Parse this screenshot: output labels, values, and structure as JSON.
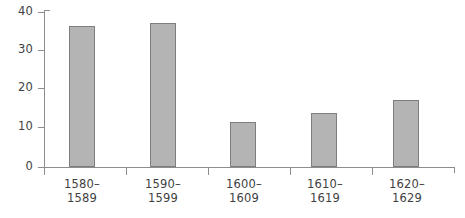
{
  "chart_data": {
    "type": "bar",
    "title": "",
    "subtitle": "",
    "xlabel": "",
    "ylabel": "",
    "categories": [
      "1580–\n1589",
      "1590–\n1599",
      "1600–\n1609",
      "1610–\n1619",
      "1620–\n1629"
    ],
    "category_lines": [
      [
        "1580–",
        "1589"
      ],
      [
        "1590–",
        "1599"
      ],
      [
        "1600–",
        "1609"
      ],
      [
        "1610–",
        "1619"
      ],
      [
        "1620–",
        "1629"
      ]
    ],
    "values": [
      36.4,
      37.2,
      11.6,
      13.9,
      17.3
    ],
    "ylim": [
      0,
      40
    ],
    "yticks": [
      0,
      10,
      20,
      30,
      40
    ],
    "ytick_labels": [
      "0",
      "10",
      "20",
      "30",
      "40"
    ],
    "xlim_note": "categorical",
    "grid": false,
    "legend": false,
    "legend_position": "none",
    "bar_fill_color": "#b4b4b4",
    "bar_border_color": "#7e7e7e",
    "axis_color": "#8d8d8d",
    "text_color": "#3f3f3f",
    "background_color": "#ffffff"
  },
  "axes": {
    "y": {
      "ticks": [
        {
          "label": "40",
          "value": 40
        },
        {
          "label": "30",
          "value": 30
        },
        {
          "label": "20",
          "value": 20
        },
        {
          "label": "10",
          "value": 10
        },
        {
          "label": "0",
          "value": 0
        }
      ]
    },
    "x": {
      "labels": [
        {
          "line1": "1580–",
          "line2": "1589"
        },
        {
          "line1": "1590–",
          "line2": "1599"
        },
        {
          "line1": "1600–",
          "line2": "1609"
        },
        {
          "line1": "1610–",
          "line2": "1619"
        },
        {
          "line1": "1620–",
          "line2": "1629"
        }
      ]
    }
  }
}
